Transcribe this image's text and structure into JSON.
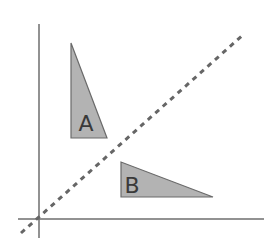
{
  "diagram": {
    "colors": {
      "background": "#ffffff",
      "axis": "#6e6e6e",
      "triangle_fill": "#b3b3b3",
      "triangle_stroke": "#6a6a6a",
      "dashed_line": "#666666",
      "label_text": "#3a3a3a"
    },
    "axes": {
      "x_axis": {
        "x1": 18,
        "y1": 219,
        "x2": 264,
        "y2": 219
      },
      "y_axis": {
        "x1": 39,
        "y1": 24,
        "x2": 39,
        "y2": 238
      }
    },
    "mirror_line": {
      "x1": 21,
      "y1": 233,
      "x2": 244,
      "y2": 34,
      "style": "dashed"
    },
    "shapes": [
      {
        "label": "A",
        "points": "71,43 71,138 107,138",
        "label_x": 86,
        "label_y": 131
      },
      {
        "label": "B",
        "points": "121,162 121,197 213,197",
        "label_x": 132,
        "label_y": 193
      }
    ]
  }
}
